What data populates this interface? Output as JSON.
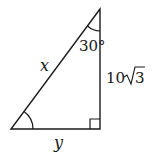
{
  "diagram": {
    "type": "right-triangle",
    "labels": {
      "hypotenuse": "x",
      "base": "y",
      "vertical_side_coef": "10",
      "vertical_side_radicand": "3",
      "top_angle": "30°"
    },
    "marks": {
      "right_angle": "bottom-right",
      "angle_arcs": [
        "top",
        "bottom-left"
      ]
    },
    "colors": {
      "stroke": "#1a1a1a",
      "background": "#ffffff"
    }
  }
}
